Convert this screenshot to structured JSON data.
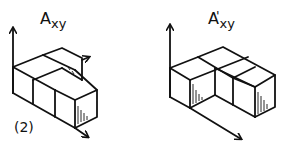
{
  "figures": [
    {
      "id": "left",
      "title_main": "A",
      "title_sub": "xy",
      "title_prime": "",
      "tag": "(2)",
      "description": "isometric stack of unit cubes: front row of 3 cubes, back row of 2 cubes"
    },
    {
      "id": "right",
      "title_main": "A",
      "title_sub": "xy",
      "title_prime": "'",
      "tag": "",
      "description": "isometric arrangement of unit cubes with a missing front-middle cube"
    }
  ],
  "colors": {
    "ink": "#111111",
    "background": "#ffffff"
  }
}
